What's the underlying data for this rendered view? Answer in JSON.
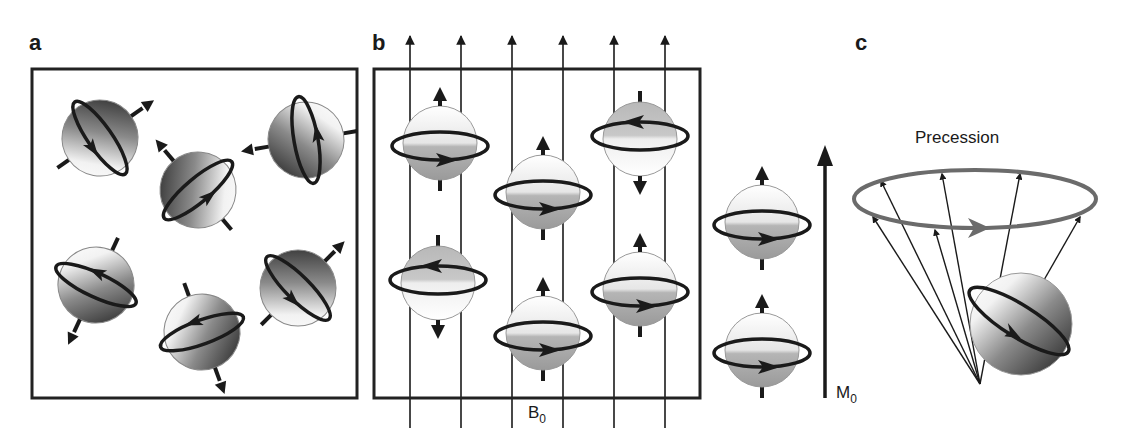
{
  "figure": {
    "panels": [
      {
        "id": "a",
        "label": "a",
        "description": "Randomly oriented nuclear spins without external field"
      },
      {
        "id": "b",
        "label": "b",
        "description": "Spins aligned parallel/antiparallel in external field B0"
      },
      {
        "id": "c",
        "label": "c",
        "description": "Precession of spin around field axis"
      }
    ],
    "labels": {
      "field_main": "B",
      "field_sub": "0",
      "magnetization_main": "M",
      "magnetization_sub": "0",
      "precession": "Precession"
    },
    "colors": {
      "ink": "#1a1a1a",
      "box": "#222222",
      "precession_ring": "#6b6b6b",
      "sphere_light": "#f4f4f4",
      "sphere_dark": "#2e2e2e",
      "sphere_mid": "#b0b0b0"
    }
  }
}
